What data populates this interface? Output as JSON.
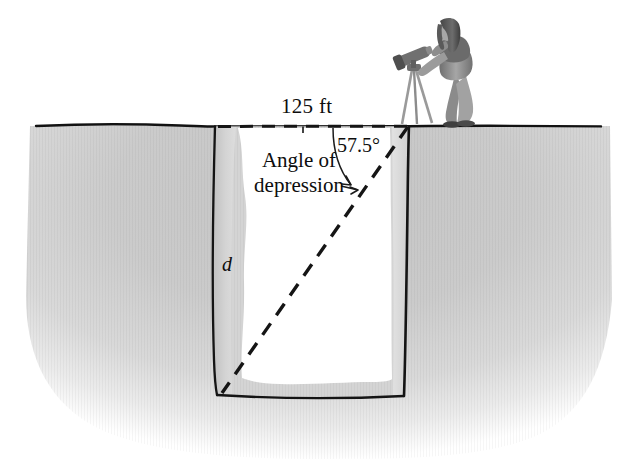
{
  "figure": {
    "ground_distance_label": "125 ft",
    "angle_label": "57.5°",
    "annotation_line1": "Angle of",
    "annotation_line2": "depression",
    "depth_label": "d",
    "icons": {
      "surveyor": "surveyor-person-icon",
      "transit": "transit-telescope-icon",
      "tripod": "tripod-icon"
    },
    "colors": {
      "ink": "#0d0d0d",
      "earth_light": "#e8e8e8",
      "earth_mid": "#cfcfcf",
      "earth_dark": "#bdbdbd",
      "pit_wall": "#d2d2d2",
      "pit_interior": "#ffffff",
      "figure_dark": "#4a4a4a",
      "figure_mid": "#8f8f8f",
      "figure_light": "#c9c9c9",
      "background": "#ffffff"
    },
    "geometry": {
      "ground_y": 126,
      "ground_left_x": 36,
      "ground_right_x": 601,
      "pit_left_x": 215,
      "pit_right_x": 409,
      "pit_bottom_y": 396,
      "sight_from": "409,126",
      "sight_to": "222,393"
    }
  }
}
